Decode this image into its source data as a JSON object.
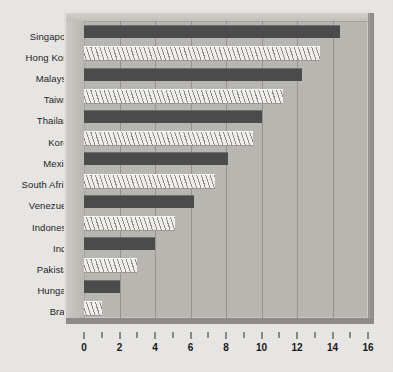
{
  "chart_data": {
    "type": "bar",
    "orientation": "horizontal",
    "title": "",
    "xlabel": "",
    "ylabel": "",
    "xlim": [
      0,
      16
    ],
    "xticks": [
      0,
      2,
      4,
      6,
      8,
      10,
      12,
      14,
      16
    ],
    "xtick_labels": [
      "0",
      "2",
      "4",
      "6",
      "8",
      "10",
      "12",
      "14",
      "16"
    ],
    "minor_xticks": [
      1,
      3,
      5,
      7,
      9,
      11,
      13,
      15
    ],
    "grid": true,
    "grid_axis": "x",
    "legend": null,
    "categories": [
      "Singapore",
      "Hong Kong",
      "Malaysia",
      "Taiwan",
      "Thailand",
      "Korea",
      "Mexico",
      "South Africa",
      "Venezuela",
      "Indonesia",
      "India",
      "Pakistan",
      "Hungary",
      "Brazil"
    ],
    "values": [
      14.4,
      13.3,
      12.3,
      11.2,
      10.0,
      9.5,
      8.1,
      7.4,
      6.2,
      5.1,
      4.0,
      3.0,
      2.0,
      1.0
    ],
    "bar_styles": [
      "solid",
      "hatch",
      "solid",
      "hatch",
      "solid",
      "hatch",
      "solid",
      "hatch",
      "solid",
      "hatch",
      "solid",
      "hatch",
      "solid",
      "hatch"
    ],
    "colors": {
      "solid_bar": "#4a4a4a",
      "hatch_bar_light": "#f2f1ef",
      "hatch_bar_dark": "#8f8d89",
      "plot_background": "#b9b7b2",
      "page_background": "#e9e8e6",
      "gridline": "#8f8d89",
      "axis_text": "#141414"
    }
  }
}
